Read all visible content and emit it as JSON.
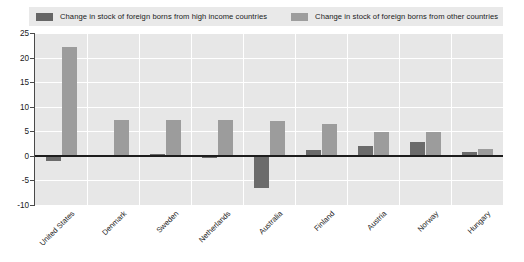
{
  "chart_data": {
    "type": "bar",
    "title": "",
    "subtitle": "",
    "xlabel": "",
    "ylabel": "",
    "ylim": [
      -10,
      25
    ],
    "yticks": [
      25,
      20,
      15,
      10,
      5,
      0,
      -5,
      -10
    ],
    "ytick_labels": [
      "25",
      "20",
      "15",
      "10",
      "5",
      "0",
      "-5",
      "-10"
    ],
    "grid": true,
    "legend_position": "top",
    "categories": [
      "United States",
      "Denmark",
      "Sweden",
      "Netherlands",
      "Australia",
      "Finland",
      "Austria",
      "Norway",
      "Hungary"
    ],
    "series": [
      {
        "name": "Change in stock of foreign borns from high income countries",
        "color": "#6b6b6b",
        "values": [
          -1.1,
          0.2,
          0.3,
          -0.4,
          -6.5,
          1.1,
          2.0,
          2.8,
          0.8
        ]
      },
      {
        "name": "Change in stock of foreign borns from other countries",
        "color": "#9c9c9c",
        "values": [
          22.1,
          7.2,
          7.2,
          7.2,
          7.0,
          6.5,
          4.8,
          4.8,
          1.3
        ]
      }
    ]
  },
  "legend": {
    "entries": [
      {
        "label": "Change in stock of foreign borns from high income countries",
        "swatch": "dark"
      },
      {
        "label": "Change in stock of foreign borns from other countries",
        "swatch": "light"
      }
    ]
  },
  "colors": {
    "series_high_income": "#6b6b6b",
    "series_other": "#9c9c9c",
    "plot_background": "#e7e7e7",
    "legend_background": "#e9e9e9",
    "gridline": "#ffffff",
    "axis": "#4a4a4a",
    "zero_line": "#1d1d1d",
    "text": "#1a1a1a"
  }
}
